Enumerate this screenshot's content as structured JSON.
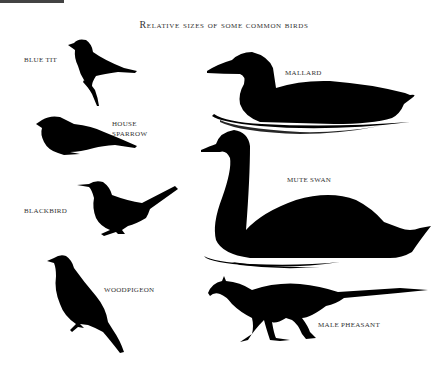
{
  "title": "Relative sizes of some common birds",
  "birds": [
    {
      "label": "Blue tit",
      "icon": "blue-tit-silhouette"
    },
    {
      "label": "House",
      "label2": "Sparrow",
      "icon": "house-sparrow-silhouette"
    },
    {
      "label": "Blackbird",
      "icon": "blackbird-silhouette"
    },
    {
      "label": "Woodpigeon",
      "icon": "woodpigeon-silhouette"
    },
    {
      "label": "Mallard",
      "icon": "mallard-silhouette"
    },
    {
      "label": "Mute swan",
      "icon": "mute-swan-silhouette"
    },
    {
      "label": "Male pheasant",
      "icon": "male-pheasant-silhouette"
    }
  ],
  "colors": {
    "silhouette": "#000000",
    "text": "#333333",
    "background": "#ffffff"
  }
}
